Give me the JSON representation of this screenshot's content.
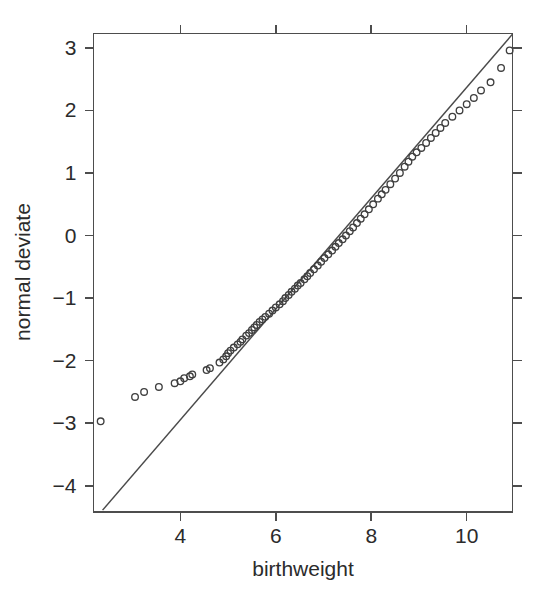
{
  "chart_data": {
    "type": "scatter",
    "title": "",
    "subtitle": "",
    "xlabel": "birthweight",
    "ylabel": "normal deviate",
    "xlim": [
      2.18,
      10.96
    ],
    "ylim": [
      -4.42,
      3.23
    ],
    "xticks": [
      4,
      6,
      8,
      10
    ],
    "xtick_labels": [
      "4",
      "6",
      "8",
      "10"
    ],
    "yticks": [
      3,
      2,
      1,
      0,
      -1,
      -2,
      -3,
      -4
    ],
    "ytick_labels": [
      "3",
      "2",
      "1",
      "0",
      "-1",
      "-2",
      "-3",
      "-4"
    ],
    "grid": false,
    "legend": null,
    "box_frame": true,
    "ticks_on_all_sides": true,
    "marker": "open-circle",
    "marker_size": 6.6,
    "point_color": "#3f3f3f",
    "line_color": "#4a4a4a",
    "axis_color": "#4d4d4d",
    "background": "#ffffff",
    "reference_line": {
      "description": "straight qqline through the quartiles",
      "x": [
        2.37,
        10.96
      ],
      "y": [
        -4.39,
        3.22
      ],
      "slope": 0.886,
      "intercept": -6.49
    },
    "series": [
      {
        "name": "birthweight quantiles",
        "x": [
          2.33,
          3.05,
          3.24,
          3.55,
          3.88,
          4.0,
          4.08,
          4.2,
          4.25,
          4.55,
          4.62,
          4.82,
          4.9,
          4.96,
          5.0,
          5.05,
          5.12,
          5.2,
          5.26,
          5.3,
          5.38,
          5.44,
          5.5,
          5.55,
          5.6,
          5.66,
          5.72,
          5.78,
          5.86,
          5.93,
          6.0,
          6.08,
          6.15,
          6.2,
          6.27,
          6.33,
          6.4,
          6.46,
          6.52,
          6.6,
          6.66,
          6.72,
          6.8,
          6.88,
          6.95,
          7.02,
          7.1,
          7.18,
          7.25,
          7.32,
          7.4,
          7.47,
          7.55,
          7.62,
          7.7,
          7.78,
          7.86,
          7.95,
          8.04,
          8.14,
          8.22,
          8.3,
          8.4,
          8.5,
          8.6,
          8.7,
          8.78,
          8.86,
          8.95,
          9.05,
          9.15,
          9.25,
          9.35,
          9.45,
          9.55,
          9.7,
          9.85,
          10.0,
          10.15,
          10.3,
          10.5,
          10.72,
          10.9
        ],
        "y": [
          -2.97,
          -2.58,
          -2.5,
          -2.42,
          -2.36,
          -2.33,
          -2.28,
          -2.25,
          -2.22,
          -2.15,
          -2.12,
          -2.03,
          -1.98,
          -1.93,
          -1.88,
          -1.84,
          -1.79,
          -1.74,
          -1.7,
          -1.66,
          -1.6,
          -1.56,
          -1.51,
          -1.47,
          -1.43,
          -1.38,
          -1.34,
          -1.3,
          -1.25,
          -1.2,
          -1.15,
          -1.1,
          -1.05,
          -1.0,
          -0.95,
          -0.9,
          -0.85,
          -0.8,
          -0.76,
          -0.7,
          -0.65,
          -0.6,
          -0.54,
          -0.48,
          -0.42,
          -0.36,
          -0.3,
          -0.24,
          -0.18,
          -0.12,
          -0.06,
          0.0,
          0.07,
          0.13,
          0.2,
          0.27,
          0.34,
          0.42,
          0.5,
          0.59,
          0.66,
          0.73,
          0.82,
          0.91,
          1.0,
          1.1,
          1.18,
          1.26,
          1.33,
          1.4,
          1.48,
          1.56,
          1.64,
          1.72,
          1.8,
          1.9,
          2.0,
          2.1,
          2.2,
          2.32,
          2.45,
          2.68,
          2.96
        ],
        "n_points": 83
      }
    ]
  },
  "axis": {
    "x_title": "birthweight",
    "y_title": "normal deviate"
  }
}
